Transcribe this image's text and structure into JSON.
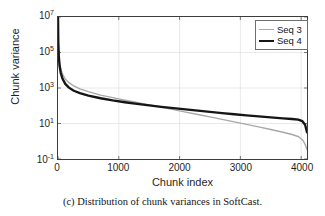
{
  "figure": {
    "caption": "(c) Distribution of chunk variances in SoftCast.",
    "scan_artifact": ""
  },
  "chart_data": {
    "type": "line",
    "title": "",
    "xlabel": "Chunk index",
    "ylabel": "Chunk variance",
    "xlim": [
      0,
      4096
    ],
    "ylim": [
      0.1,
      10000000
    ],
    "yscale": "log",
    "xscale": "linear",
    "grid": true,
    "legend_position": "top-right",
    "xticks": [
      0,
      1000,
      2000,
      3000,
      4000
    ],
    "xtick_labels": [
      "0",
      "1000",
      "2000",
      "3000",
      "4000"
    ],
    "yticks": [
      0.1,
      10,
      1000,
      100000,
      10000000
    ],
    "ytick_labels": [
      "10-1",
      "101",
      "103",
      "105",
      "107"
    ],
    "ytick_mantissa": [
      "10",
      "10",
      "10",
      "10",
      "10"
    ],
    "ytick_exponent": [
      "-1",
      "1",
      "3",
      "5",
      "7"
    ],
    "series": [
      {
        "name": "Seq 3",
        "color": "#a8a8a8",
        "width": 1.4,
        "x": [
          0,
          5,
          12,
          25,
          45,
          75,
          120,
          180,
          260,
          360,
          500,
          700,
          900,
          1100,
          1300,
          1500,
          1700,
          1900,
          2100,
          2300,
          2500,
          2700,
          2900,
          3100,
          3300,
          3500,
          3700,
          3850,
          3960,
          4030,
          4070,
          4096
        ],
        "y": [
          9000000,
          400000,
          90000,
          28000,
          12000,
          6000,
          3200,
          2000,
          1300,
          900,
          620,
          400,
          285,
          205,
          152,
          112,
          82,
          60,
          44,
          32,
          23.5,
          17,
          12.4,
          9.0,
          6.4,
          4.6,
          3.2,
          2.4,
          1.8,
          1.1,
          0.62,
          0.34
        ]
      },
      {
        "name": "Seq 4",
        "color": "#151515",
        "width": 2.4,
        "x": [
          0,
          5,
          12,
          25,
          45,
          75,
          120,
          180,
          260,
          360,
          500,
          700,
          900,
          1100,
          1300,
          1500,
          1700,
          1900,
          2100,
          2300,
          2500,
          2700,
          2900,
          3100,
          3300,
          3500,
          3700,
          3850,
          3950,
          4020,
          4065,
          4096
        ],
        "y": [
          9000000,
          350000,
          70000,
          19000,
          7200,
          3300,
          1700,
          1050,
          700,
          510,
          375,
          265,
          200,
          158,
          128,
          105,
          87,
          73,
          62,
          53,
          45,
          38.5,
          33,
          28.5,
          25,
          22,
          19.5,
          18,
          16.5,
          13.5,
          8.5,
          3.2
        ]
      }
    ]
  }
}
